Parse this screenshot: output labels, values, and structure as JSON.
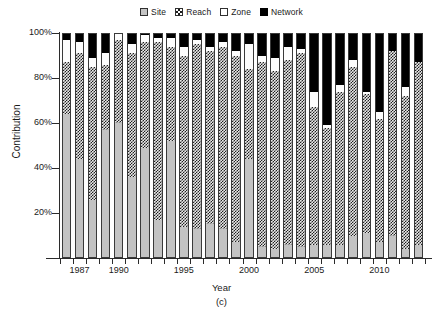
{
  "chart_data": {
    "type": "bar",
    "stacked": true,
    "title": "",
    "xlabel": "Year",
    "ylabel": "Contribution",
    "panel_label": "(c)",
    "ylim": [
      0,
      100
    ],
    "ytick_values": [
      20,
      40,
      60,
      80,
      100
    ],
    "ytick_labels": [
      "20%",
      "40%",
      "60%",
      "80%",
      "100%"
    ],
    "xtick_labels": [
      "1987",
      "1990",
      "1995",
      "2000",
      "2005",
      "2010"
    ],
    "xtick_years": [
      1987,
      1990,
      1995,
      2000,
      2005,
      2010
    ],
    "grid": false,
    "legend_position": "top-center",
    "categories": [
      1986,
      1987,
      1988,
      1989,
      1990,
      1991,
      1992,
      1993,
      1994,
      1995,
      1996,
      1997,
      1998,
      1999,
      2000,
      2001,
      2002,
      2003,
      2004,
      2005,
      2006,
      2007,
      2008,
      2009,
      2010,
      2011,
      2012,
      2013
    ],
    "series": [
      {
        "name": "Site",
        "color": "#c3c3c3",
        "pattern": "solid-gray",
        "values": [
          64,
          44,
          26,
          57,
          60,
          36,
          49,
          17,
          52,
          14,
          13,
          15,
          13,
          7,
          44,
          5,
          4,
          6,
          5,
          6,
          6,
          6,
          10,
          11,
          7,
          10,
          4,
          6
        ]
      },
      {
        "name": "Reach",
        "color": "#1f1f1f",
        "pattern": "checkerboard",
        "values": [
          23,
          47,
          59,
          29,
          37,
          55,
          47,
          79,
          42,
          76,
          82,
          77,
          81,
          83,
          40,
          82,
          79,
          82,
          86,
          61,
          52,
          68,
          75,
          62,
          55,
          82,
          68,
          81
        ]
      },
      {
        "name": "Zone",
        "color": "#ffffff",
        "pattern": "white",
        "values": [
          10,
          5,
          4,
          5,
          3,
          4,
          3,
          2,
          4,
          4,
          2,
          2,
          2,
          2,
          11,
          3,
          6,
          6,
          2,
          7,
          1,
          3,
          3,
          1,
          3,
          0,
          4,
          0
        ]
      },
      {
        "name": "Network",
        "color": "#000000",
        "pattern": "solid-black",
        "values": [
          3,
          4,
          11,
          9,
          0,
          5,
          1,
          2,
          2,
          6,
          3,
          6,
          4,
          8,
          5,
          10,
          11,
          6,
          7,
          26,
          41,
          23,
          12,
          26,
          35,
          8,
          24,
          13
        ]
      }
    ]
  },
  "legend": {
    "items": [
      {
        "label": "Site",
        "swatch": "sw-site"
      },
      {
        "label": "Reach",
        "swatch": "sw-reach"
      },
      {
        "label": "Zone",
        "swatch": "sw-zone"
      },
      {
        "label": "Network",
        "swatch": "sw-network"
      }
    ]
  }
}
